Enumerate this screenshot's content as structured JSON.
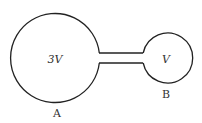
{
  "diagram": {
    "vessel_a": {
      "volume_label": "3V",
      "name_label": "A"
    },
    "vessel_b": {
      "volume_label": "V",
      "name_label": "B"
    },
    "colors": {
      "stroke": "#222222",
      "background": "#ffffff"
    }
  }
}
